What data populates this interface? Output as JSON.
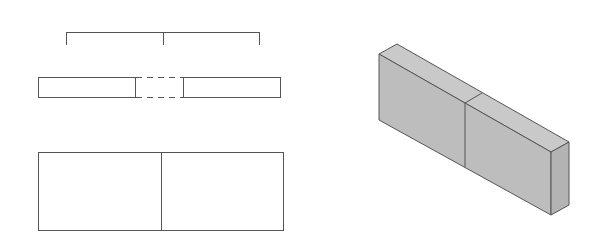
{
  "diagram": {
    "colors": {
      "line": "#555555",
      "fill_top": "#c9c9c9",
      "fill_front": "#bdbdbd",
      "fill_side": "#b3b3b3",
      "background": "#ffffff"
    },
    "views": [
      {
        "name": "dimension-bracket",
        "type": "bracket",
        "segments": 2
      },
      {
        "name": "plan-view",
        "type": "split-bar",
        "joint": "dashed"
      },
      {
        "name": "front-elevation",
        "type": "rectangle",
        "segments": 2
      },
      {
        "name": "isometric-view",
        "type": "isometric-block",
        "segments": 2
      }
    ]
  }
}
